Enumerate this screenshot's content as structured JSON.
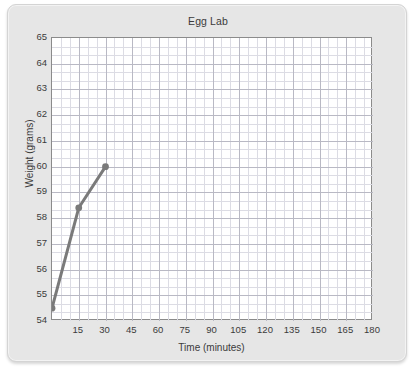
{
  "chart_data": {
    "type": "line",
    "title": "Egg Lab",
    "xlabel": "Time (minutes)",
    "ylabel": "Weight (grams)",
    "xlim": [
      0,
      180
    ],
    "ylim": [
      54,
      65
    ],
    "xticks": [
      0,
      15,
      30,
      45,
      60,
      75,
      90,
      105,
      120,
      135,
      150,
      165,
      180
    ],
    "xtick_labels": [
      "",
      "15",
      "30",
      "45",
      "60",
      "75",
      "90",
      "105",
      "120",
      "135",
      "150",
      "165",
      "180"
    ],
    "yticks": [
      54,
      55,
      56,
      57,
      58,
      59,
      60,
      61,
      62,
      63,
      64,
      65
    ],
    "ytick_labels": [
      "54",
      "55",
      "56",
      "57",
      "58",
      "59",
      "60",
      "61",
      "62",
      "63",
      "64",
      "65"
    ],
    "grid": true,
    "minor_grid": true,
    "x_minor_per_major": 3,
    "y_minor_per_major": 3,
    "legend": false,
    "series": [
      {
        "name": "Egg weight",
        "x": [
          0,
          15,
          30
        ],
        "y": [
          54.5,
          58.4,
          60.0
        ],
        "color": "#7a7a7a",
        "marker": "circle",
        "line_width": 3
      }
    ]
  },
  "colors": {
    "card_background": "#e6e6e6",
    "plot_background": "#ffffff",
    "plot_border": "#8b8b8b",
    "grid_major": "#b9b9c4",
    "grid_minor": "#dcdce4",
    "text": "#3b3b3b",
    "series": "#7a7a7a"
  }
}
